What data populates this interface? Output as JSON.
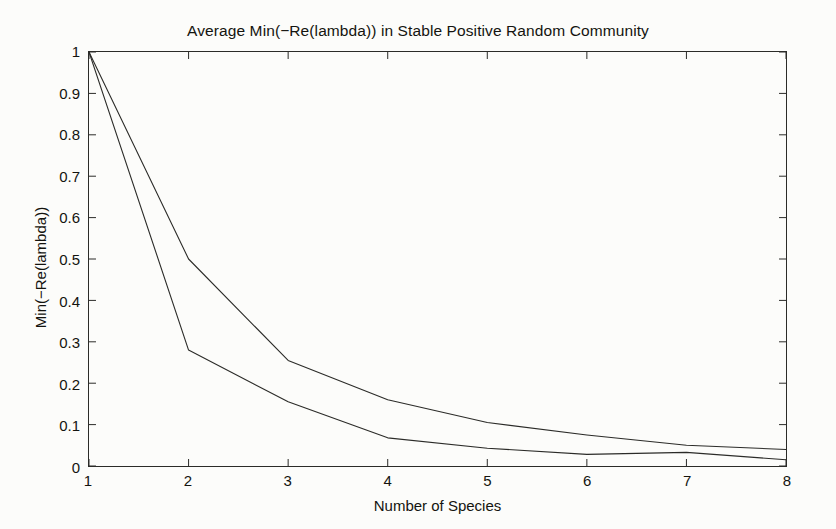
{
  "chart_data": {
    "type": "line",
    "title": "Average Min(−Re(lambda)) in Stable Positive Random Community",
    "xlabel": "Number of Species",
    "ylabel": "Min(−Re(lambda))",
    "x": [
      1,
      2,
      3,
      4,
      5,
      6,
      7,
      8
    ],
    "xlim": [
      1,
      8
    ],
    "ylim": [
      0,
      1
    ],
    "xticks": [
      "1",
      "2",
      "3",
      "4",
      "5",
      "6",
      "7",
      "8"
    ],
    "yticks": [
      "0",
      "0.1",
      "0.2",
      "0.3",
      "0.4",
      "0.5",
      "0.6",
      "0.7",
      "0.8",
      "0.9",
      "1"
    ],
    "ytick_values": [
      0,
      0.1,
      0.2,
      0.3,
      0.4,
      0.5,
      0.6,
      0.7,
      0.8,
      0.9,
      1
    ],
    "grid": false,
    "legend": null,
    "series": [
      {
        "name": "upper-curve",
        "color": "#2b2b28",
        "values": [
          1.0,
          0.5,
          0.255,
          0.16,
          0.105,
          0.075,
          0.05,
          0.04
        ]
      },
      {
        "name": "lower-curve",
        "color": "#2b2b28",
        "values": [
          1.0,
          0.28,
          0.155,
          0.068,
          0.043,
          0.028,
          0.033,
          0.015
        ]
      }
    ]
  },
  "figure": {
    "background_color": "#fcfcfa",
    "axis_color": "#2b2b28",
    "line_width": 1.1
  }
}
